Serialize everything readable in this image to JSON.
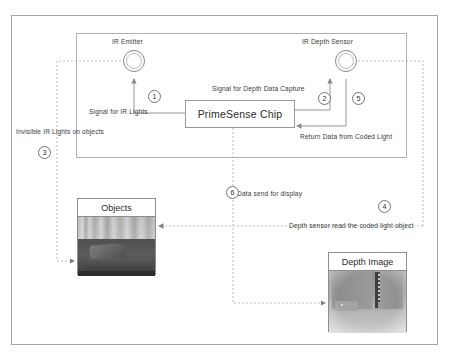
{
  "diagram": {
    "device": {
      "emitter_label": "IR Emitter",
      "sensor_label": "IR Depth Sensor",
      "chip_label": "PrimeSense Chip"
    },
    "signals": {
      "ir_lights": "Signal for IR Lights",
      "depth_capture": "Signal for Depth Data Capture",
      "return_data": "Return Data from Coded Light",
      "invisible_ir": "Invisible IR Lights on objects",
      "data_send": "Data send for display",
      "depth_read": "Depth  sensor read the  coded light object"
    },
    "steps": [
      {
        "id": "1",
        "label": "1"
      },
      {
        "id": "2",
        "label": "2"
      },
      {
        "id": "3",
        "label": "3"
      },
      {
        "id": "4",
        "label": "4"
      },
      {
        "id": "5",
        "label": "5"
      },
      {
        "id": "6",
        "label": "6"
      }
    ],
    "panels": {
      "objects_caption": "Objects",
      "depth_caption": "Depth Image"
    },
    "colors": {
      "outer_border": "#a6a6a6",
      "inner_border": "#b0b0b0",
      "solid_connector": "#8a8a8a",
      "dashed_connector": "#b5b5b5",
      "text": "#3a3a3a",
      "background": "#ffffff"
    }
  }
}
